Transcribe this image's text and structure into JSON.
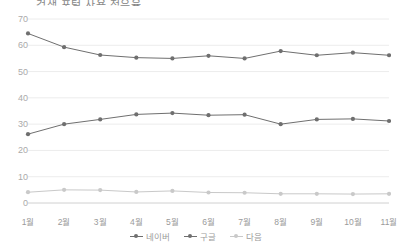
{
  "chart_data": {
    "type": "line",
    "title": "검색 포털 사용 점유율",
    "xlabel": "",
    "ylabel": "",
    "ylim": [
      0,
      70
    ],
    "yticks": [
      0,
      10,
      20,
      30,
      40,
      50,
      60,
      70
    ],
    "grid": true,
    "legend_position": "bottom",
    "categories": [
      "1월",
      "2월",
      "3월",
      "4월",
      "5월",
      "6월",
      "7월",
      "8월",
      "9월",
      "10월",
      "11월"
    ],
    "series": [
      {
        "name": "네이버",
        "color": "#6f6f6f",
        "values": [
          64.5,
          59.3,
          56.3,
          55.3,
          55.0,
          56.0,
          55.0,
          57.8,
          56.2,
          57.2,
          56.2
        ]
      },
      {
        "name": "구글",
        "color": "#6f6f6f",
        "values": [
          26.2,
          30.0,
          31.8,
          33.7,
          34.2,
          33.4,
          33.6,
          30.0,
          31.8,
          32.0,
          31.2
        ]
      },
      {
        "name": "다음",
        "color": "#c9c9c9",
        "values": [
          4.1,
          5.0,
          4.9,
          4.2,
          4.6,
          4.0,
          3.9,
          3.5,
          3.5,
          3.4,
          3.5
        ]
      }
    ]
  }
}
